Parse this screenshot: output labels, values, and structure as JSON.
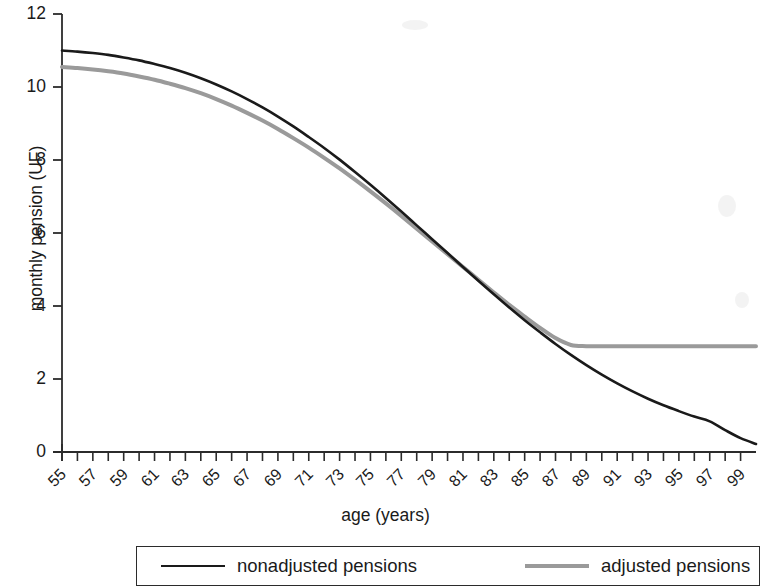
{
  "chart_data": {
    "type": "line",
    "title": "",
    "xlabel": "age (years)",
    "ylabel": "monthly pension (UF)",
    "xlim": [
      55,
      100
    ],
    "ylim": [
      0,
      12
    ],
    "ytick_values": [
      0,
      2,
      4,
      6,
      8,
      10,
      12
    ],
    "ytick_labels": [
      "0",
      "2",
      "4",
      "6",
      "8",
      "10",
      "12"
    ],
    "xtick_labels": [
      "55",
      "57",
      "59",
      "61",
      "63",
      "65",
      "67",
      "69",
      "71",
      "73",
      "75",
      "77",
      "79",
      "81",
      "83",
      "85",
      "87",
      "89",
      "91",
      "93",
      "95",
      "97",
      "99"
    ],
    "xtick_values": [
      55,
      57,
      59,
      61,
      63,
      65,
      67,
      69,
      71,
      73,
      75,
      77,
      79,
      81,
      83,
      85,
      87,
      89,
      91,
      93,
      95,
      97,
      99
    ],
    "x_minor_step": 1,
    "grid": false,
    "legend_position": "below-plot",
    "series": [
      {
        "name": "nonadjusted pensions",
        "color": "#1a1a1a",
        "linewidth": 2.6,
        "x": [
          55,
          56,
          57,
          58,
          59,
          60,
          61,
          62,
          63,
          64,
          65,
          66,
          67,
          68,
          69,
          70,
          71,
          72,
          73,
          74,
          75,
          76,
          77,
          78,
          79,
          80,
          81,
          82,
          83,
          84,
          85,
          86,
          87,
          88,
          89,
          90,
          91,
          92,
          93,
          94,
          95,
          96,
          97,
          98,
          99,
          100
        ],
        "values": [
          11.0,
          10.97,
          10.93,
          10.88,
          10.81,
          10.73,
          10.63,
          10.52,
          10.39,
          10.24,
          10.07,
          9.88,
          9.67,
          9.44,
          9.19,
          8.92,
          8.63,
          8.33,
          8.01,
          7.67,
          7.32,
          6.96,
          6.59,
          6.21,
          5.83,
          5.45,
          5.07,
          4.69,
          4.32,
          3.96,
          3.61,
          3.28,
          2.96,
          2.66,
          2.38,
          2.12,
          1.88,
          1.66,
          1.46,
          1.28,
          1.12,
          0.97,
          0.84,
          0.6,
          0.38,
          0.22
        ]
      },
      {
        "name": "adjusted pensions",
        "color": "#9a9a9a",
        "linewidth": 4.0,
        "x": [
          55,
          56,
          57,
          58,
          59,
          60,
          61,
          62,
          63,
          64,
          65,
          66,
          67,
          68,
          69,
          70,
          71,
          72,
          73,
          74,
          75,
          76,
          77,
          78,
          79,
          80,
          81,
          82,
          83,
          84,
          85,
          86,
          87,
          88,
          89,
          90,
          91,
          92,
          93,
          94,
          95,
          96,
          97,
          98,
          99,
          100
        ],
        "values": [
          10.55,
          10.52,
          10.48,
          10.43,
          10.37,
          10.29,
          10.2,
          10.09,
          9.97,
          9.83,
          9.67,
          9.49,
          9.29,
          9.08,
          8.85,
          8.6,
          8.34,
          8.06,
          7.77,
          7.46,
          7.14,
          6.81,
          6.47,
          6.12,
          5.77,
          5.42,
          5.07,
          4.72,
          4.37,
          4.03,
          3.71,
          3.4,
          3.12,
          2.93,
          2.9,
          2.9,
          2.9,
          2.9,
          2.9,
          2.9,
          2.9,
          2.9,
          2.9,
          2.9,
          2.9,
          2.9
        ],
        "floor_value": 2.9,
        "floor_start_age": 88
      }
    ],
    "annotations": []
  },
  "legend": {
    "entries": [
      {
        "label": "nonadjusted pensions",
        "style": "black-line"
      },
      {
        "label": "adjusted pensions",
        "style": "gray-line"
      }
    ]
  }
}
